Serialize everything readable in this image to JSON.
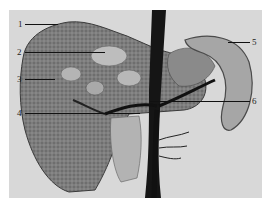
{
  "figure": {
    "background_color": "#d8d8d8",
    "page_color": "#ffffff",
    "tissue_colors": {
      "liver_parenchyma": "#7a7a7a",
      "vessel_dark": "#141414",
      "gallbladder": "#b0b0b0",
      "spleen_edge": "#555555",
      "spleen_face": "#a8a8a8",
      "highlight": "#c9c9c9"
    }
  },
  "labels": [
    {
      "id": "1",
      "text": "1",
      "side": "left",
      "y": 24
    },
    {
      "id": "2",
      "text": "2",
      "side": "left",
      "y": 52
    },
    {
      "id": "3",
      "text": "3",
      "side": "left",
      "y": 79
    },
    {
      "id": "4",
      "text": "4",
      "side": "left",
      "y": 113
    },
    {
      "id": "5",
      "text": "5",
      "side": "right",
      "y": 42
    },
    {
      "id": "6",
      "text": "6",
      "side": "right",
      "y": 101
    }
  ]
}
